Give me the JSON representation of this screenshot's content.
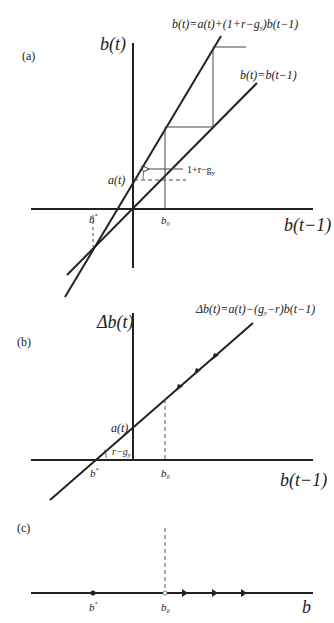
{
  "figure": {
    "panels": [
      {
        "id": "a",
        "label": "(a)",
        "y_axis_label": "b(t)",
        "x_axis_label": "b(t−1)",
        "equations": {
          "steep_line": "b(t)=a(t)+(1+r−g",
          "steep_line_sub": "y",
          "steep_line_tail": ")b(t−1)",
          "diagonal": "b(t)=b(t−1)"
        },
        "annotations": {
          "intercept": "a(t)",
          "slope_label": "1+r−g",
          "slope_sub": "y",
          "b_star": "b",
          "b_star_sup": "*",
          "b_zero": "b",
          "b_zero_sub": "0"
        }
      },
      {
        "id": "b",
        "label": "(b)",
        "y_axis_label": "Δb(t)",
        "x_axis_label": "b(t−1)",
        "equations": {
          "line": "Δb(t)=a(t)−(g",
          "line_sub": "y",
          "line_tail": "−r)b(t−1)"
        },
        "annotations": {
          "intercept": "a(t)",
          "slope_label": "r−g",
          "slope_sub": "y",
          "b_star": "b",
          "b_star_sup": "*",
          "b_zero": "b",
          "b_zero_sub": "0"
        }
      },
      {
        "id": "c",
        "label": "(c)",
        "x_axis_label": "b",
        "annotations": {
          "b_star": "b",
          "b_star_sup": "*",
          "b_zero": "b",
          "b_zero_sub": "0"
        }
      }
    ],
    "colors": {
      "ink": "#222222",
      "thin": "#444444",
      "background": "#ffffff"
    }
  }
}
